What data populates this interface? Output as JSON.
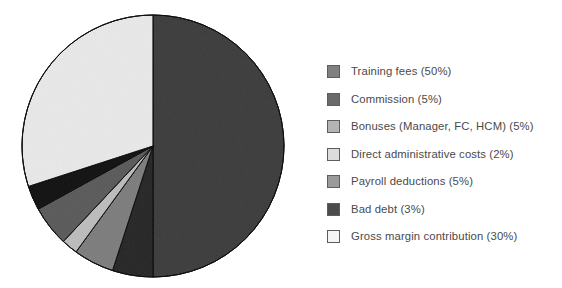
{
  "chart_data": {
    "type": "pie",
    "title": "",
    "subtitle": "",
    "xlabel": "",
    "ylabel": "",
    "grid": false,
    "legend_position": "right",
    "start_angle_deg": 0,
    "direction": "clockwise",
    "units": "percent",
    "total": 100,
    "categories": [
      "Training fees",
      "Commission",
      "Bonuses (Manager, FC, HCM)",
      "Direct administrative costs",
      "Payroll deductions",
      "Bad debt",
      "Gross margin contribution"
    ],
    "values": [
      50,
      5,
      5,
      2,
      5,
      3,
      30
    ],
    "labels": [
      "Training fees (50%)",
      "Commission (5%)",
      "Bonuses (Manager, FC, HCM) (5%)",
      "Direct administrative costs (2%)",
      "Payroll deductions (5%)",
      "Bad debt (3%)",
      "Gross margin contribution (30%)"
    ],
    "colors": [
      "#808080",
      "#6a6a6a",
      "#b4b4b4",
      "#dcdcdc",
      "#9a9a9a",
      "#4c4c4c",
      "#f4f4f4"
    ],
    "slice_outline_color": "#3c3c3c"
  },
  "legend": {
    "items": [
      {
        "label": "Training fees (50%)",
        "color": "#808080",
        "value": 50,
        "name": "Training fees"
      },
      {
        "label": "Commission (5%)",
        "color": "#6a6a6a",
        "value": 5,
        "name": "Commission"
      },
      {
        "label": "Bonuses (Manager, FC, HCM) (5%)",
        "color": "#b4b4b4",
        "value": 5,
        "name": "Bonuses (Manager, FC, HCM)"
      },
      {
        "label": "Direct administrative costs (2%)",
        "color": "#dcdcdc",
        "value": 2,
        "name": "Direct administrative costs"
      },
      {
        "label": "Payroll deductions (5%)",
        "color": "#9a9a9a",
        "value": 5,
        "name": "Payroll deductions"
      },
      {
        "label": "Bad debt (3%)",
        "color": "#4c4c4c",
        "value": 3,
        "name": "Bad debt"
      },
      {
        "label": "Gross margin contribution (30%)",
        "color": "#f4f4f4",
        "value": 30,
        "name": "Gross margin contribution"
      }
    ]
  },
  "geometry": {
    "center_x": 153,
    "center_y": 146,
    "radius": 131
  }
}
